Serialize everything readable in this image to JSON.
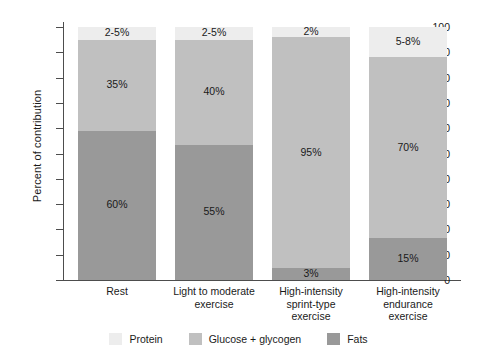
{
  "chart_data": {
    "type": "bar",
    "subtype": "stacked-bar",
    "title": "",
    "xlabel": "",
    "ylabel": "Percent of contribution",
    "ylim": [
      0,
      100
    ],
    "yticks": [
      0,
      10,
      20,
      30,
      40,
      50,
      60,
      70,
      80,
      90,
      100
    ],
    "grid": false,
    "legend_position": "bottom",
    "categories": [
      "Rest",
      "Light to moderate exercise",
      "High-intensity sprint-type exercise",
      "High-intensity endurance exercise"
    ],
    "category_lines": [
      [
        "Rest"
      ],
      [
        "Light to moderate",
        "exercise"
      ],
      [
        "High-intensity",
        "sprint-type",
        "exercise"
      ],
      [
        "High-intensity",
        "endurance",
        "exercise"
      ]
    ],
    "series": [
      {
        "name": "Fats",
        "color": "#999999",
        "values": [
          59,
          53.5,
          4.7,
          16.5
        ],
        "labels": [
          "60%",
          "55%",
          "3%",
          "15%"
        ]
      },
      {
        "name": "Glucose + glycogen",
        "color": "#c0c0c0",
        "values": [
          36,
          41.5,
          91.3,
          71.5
        ],
        "labels": [
          "35%",
          "40%",
          "95%",
          "70%"
        ]
      },
      {
        "name": "Protein",
        "color": "#ededed",
        "values": [
          5,
          5,
          4,
          12
        ],
        "labels": [
          "2-5%",
          "2-5%",
          "2%",
          "5-8%"
        ]
      }
    ]
  },
  "legend": {
    "items": [
      {
        "label": "Protein",
        "color": "#ededed"
      },
      {
        "label": "Glucose + glycogen",
        "color": "#c0c0c0"
      },
      {
        "label": "Fats",
        "color": "#999999"
      }
    ]
  },
  "axis": {
    "y_title": "Percent of contribution",
    "y_tick_labels": [
      "100",
      "90",
      "80",
      "70",
      "60",
      "50",
      "40",
      "30",
      "20",
      "10",
      "0"
    ]
  }
}
